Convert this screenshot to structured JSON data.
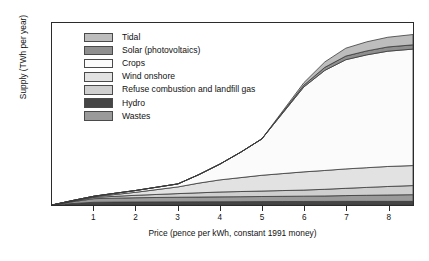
{
  "chart_data": {
    "type": "area",
    "stacked": true,
    "title": "",
    "xlabel": "Price (pence per kWh, constant 1991 money)",
    "ylabel": "Supply (TWh per year)",
    "xlim": [
      0,
      8.6
    ],
    "ylim": [
      0,
      300
    ],
    "xticks": [
      1,
      2,
      3,
      4,
      5,
      6,
      7,
      8
    ],
    "yticks": [
      0,
      50,
      100,
      150,
      200,
      250,
      300
    ],
    "grid": false,
    "legend_position": "upper-left-inside",
    "x": [
      0,
      0.5,
      1,
      1.5,
      2,
      2.5,
      3,
      3.5,
      4,
      4.5,
      5,
      5.5,
      6,
      6.5,
      7,
      7.5,
      8,
      8.6
    ],
    "series": [
      {
        "name": "Hydro",
        "color": "#454545",
        "values": [
          0,
          2.5,
          4.5,
          4.8,
          5,
          5.1,
          5.2,
          5.3,
          5.4,
          5.5,
          5.6,
          5.7,
          5.8,
          5.9,
          6,
          6,
          6,
          6
        ]
      },
      {
        "name": "Wastes",
        "color": "#9a9a9a",
        "values": [
          0,
          3,
          6,
          6.5,
          7,
          7.3,
          7.6,
          7.8,
          8,
          8.2,
          8.4,
          8.6,
          8.8,
          9,
          9.5,
          10,
          10.5,
          11
        ]
      },
      {
        "name": "Refuse combustion and landfill gas",
        "color": "#cfcfcf",
        "values": [
          0,
          1,
          2,
          3,
          4,
          5,
          6,
          7,
          8,
          8.5,
          9,
          9.5,
          10,
          11,
          12,
          13,
          14,
          15
        ]
      },
      {
        "name": "Wind onshore",
        "color": "#e2e2e2",
        "values": [
          0,
          0.5,
          1,
          3,
          5,
          8,
          11,
          16,
          20,
          23,
          26,
          28,
          30,
          31,
          32,
          32.5,
          33,
          33
        ]
      },
      {
        "name": "Crops",
        "color": "#fbfbfb",
        "values": [
          0,
          0.5,
          1,
          2,
          3,
          4,
          5,
          14,
          26,
          42,
          60,
          100,
          140,
          165,
          180,
          186,
          190,
          192
        ]
      },
      {
        "name": "Solar (photovoltaics)",
        "color": "#8f8f8f",
        "values": [
          0,
          0,
          0,
          0,
          0,
          0,
          0,
          0,
          0,
          0,
          0,
          1.5,
          3,
          5,
          6,
          6.5,
          7,
          7
        ]
      },
      {
        "name": "Tidal",
        "color": "#bdbdbd",
        "values": [
          0,
          0,
          0,
          0,
          0,
          0,
          0,
          0,
          0,
          0,
          0,
          2,
          4,
          9,
          13,
          15,
          16,
          17
        ]
      }
    ],
    "stack_totals_note": "Bands stacked bottom-up: Hydro, Wastes, Refuse combustion and landfill gas, Wind onshore, Crops, Solar (photovoltaics), Tidal",
    "total_at_max_price": 255
  },
  "legend": {
    "items": [
      {
        "label": "Tidal",
        "color": "#bdbdbd"
      },
      {
        "label": "Solar (photovoltaics)",
        "color": "#8f8f8f"
      },
      {
        "label": "Crops",
        "color": "#fbfbfb"
      },
      {
        "label": "Wind onshore",
        "color": "#e2e2e2"
      },
      {
        "label": "Refuse combustion and landfill gas",
        "color": "#cfcfcf"
      },
      {
        "label": "Hydro",
        "color": "#454545"
      },
      {
        "label": "Wastes",
        "color": "#9a9a9a"
      }
    ]
  },
  "axes": {
    "y_title": "Supply (TWh per year)",
    "x_title": "Price (pence per kWh, constant 1991 money)",
    "y_tick_labels": [
      "300",
      "250",
      "200",
      "150",
      "100",
      "50",
      "0"
    ],
    "x_tick_labels": [
      "1",
      "2",
      "3",
      "4",
      "5",
      "6",
      "7",
      "8"
    ]
  },
  "style": {
    "frame_color": "#2b2b2b",
    "line_color": "#3a3a3a",
    "background": "#ffffff"
  }
}
